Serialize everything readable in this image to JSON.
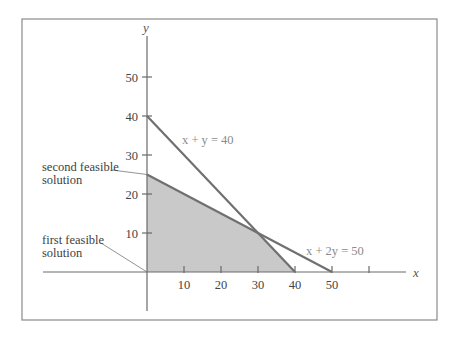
{
  "chart_data": {
    "type": "area",
    "title": "",
    "xlabel": "x",
    "ylabel": "y",
    "xlim": [
      0,
      60
    ],
    "ylim": [
      0,
      60
    ],
    "x_ticks": [
      10,
      20,
      30,
      40,
      50,
      60
    ],
    "x_tick_labels": [
      "10",
      "20",
      "30",
      "40",
      "50",
      ""
    ],
    "y_ticks": [
      10,
      20,
      30,
      40,
      50
    ],
    "y_tick_labels": [
      "10",
      "20",
      "30",
      "40",
      "50"
    ],
    "grid": false,
    "series": [
      {
        "name": "x + y = 40",
        "type": "line",
        "points": [
          [
            0,
            40
          ],
          [
            40,
            0
          ]
        ]
      },
      {
        "name": "x + 2y = 50",
        "type": "line",
        "points": [
          [
            0,
            25
          ],
          [
            50,
            0
          ]
        ]
      }
    ],
    "feasible_region": {
      "type": "polygon",
      "fill": "#c9c9c9",
      "vertices": [
        [
          0,
          0
        ],
        [
          0,
          25
        ],
        [
          30,
          10
        ],
        [
          40,
          0
        ]
      ]
    },
    "annotations": [
      {
        "text": "x + y = 40",
        "anchor": [
          10,
          33
        ]
      },
      {
        "text": "x + 2y = 50",
        "anchor": [
          43,
          5
        ]
      },
      {
        "text": "second feasible solution",
        "point": [
          0,
          25
        ]
      },
      {
        "text": "first feasible solution",
        "point": [
          0,
          0
        ]
      }
    ]
  },
  "labels": {
    "second_line1": "second feasible",
    "second_line2": "solution",
    "first_line1": "first feasible",
    "first_line2": "solution"
  },
  "colors": {
    "line": "#707070",
    "fill": "#c9c9c9",
    "label": "#8c8c8c",
    "axis": "#6a6a6a",
    "border": "#8a8a8a"
  }
}
